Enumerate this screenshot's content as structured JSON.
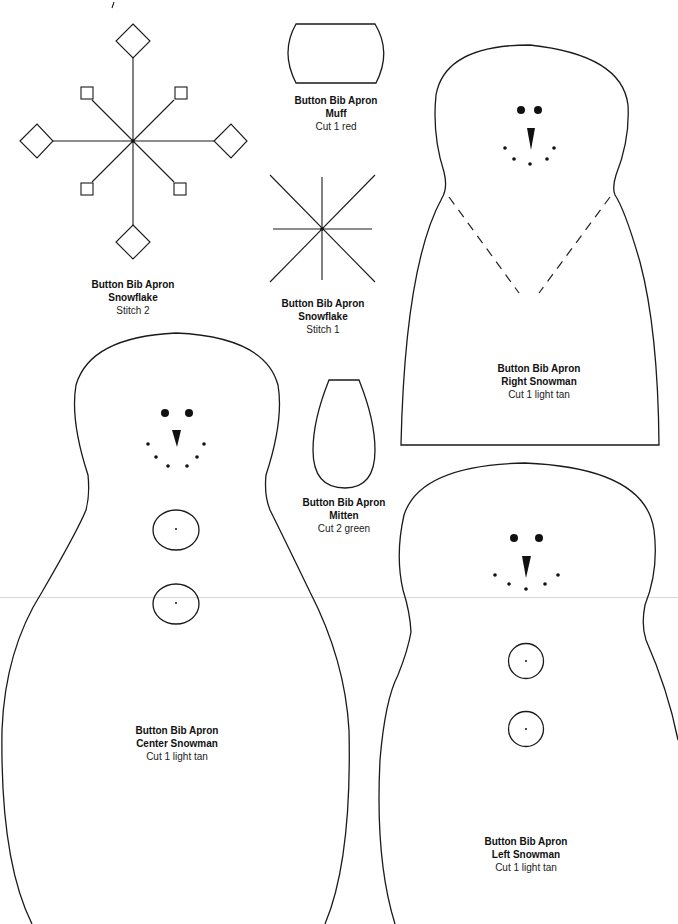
{
  "page": {
    "type": "sewing pattern sheet",
    "background": "#ffffff",
    "line_color": "#1a1a1a"
  },
  "pieces": {
    "snowflake_stitch2": {
      "line1": "Button Bib Apron",
      "line2": "Snowflake",
      "line3": "Stitch 2"
    },
    "muff": {
      "line1": "Button Bib Apron",
      "line2": "Muff",
      "line3": "Cut 1 red"
    },
    "snowflake_stitch1": {
      "line1": "Button Bib Apron",
      "line2": "Snowflake",
      "line3": "Stitch 1"
    },
    "right_snowman": {
      "line1": "Button Bib Apron",
      "line2": "Right Snowman",
      "line3": "Cut 1 light tan"
    },
    "mitten": {
      "line1": "Button Bib Apron",
      "line2": "Mitten",
      "line3": "Cut 2 green"
    },
    "center_snowman": {
      "line1": "Button Bib Apron",
      "line2": "Center Snowman",
      "line3": "Cut 1 light tan"
    },
    "left_snowman": {
      "line1": "Button Bib Apron",
      "line2": "Left Snowman",
      "line3": "Cut 1 light tan"
    }
  }
}
